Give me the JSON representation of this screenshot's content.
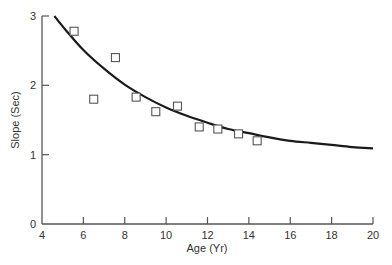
{
  "chart_data": {
    "type": "scatter",
    "title": "",
    "xlabel": "Age (Yr)",
    "ylabel": "Slope (Sec)",
    "xlim": [
      4,
      20
    ],
    "ylim": [
      0,
      3
    ],
    "xticks": [
      4,
      6,
      8,
      10,
      12,
      14,
      16,
      18,
      20
    ],
    "yticks": [
      0,
      1,
      2,
      3
    ],
    "grid": false,
    "legend": null,
    "series": [
      {
        "name": "observed",
        "type": "scatter",
        "marker": "open-square",
        "points": [
          {
            "x": 5.55,
            "y": 2.78
          },
          {
            "x": 6.5,
            "y": 1.8
          },
          {
            "x": 7.55,
            "y": 2.4
          },
          {
            "x": 8.55,
            "y": 1.83
          },
          {
            "x": 9.5,
            "y": 1.62
          },
          {
            "x": 10.55,
            "y": 1.7
          },
          {
            "x": 11.6,
            "y": 1.4
          },
          {
            "x": 12.5,
            "y": 1.37
          },
          {
            "x": 13.5,
            "y": 1.3
          },
          {
            "x": 14.4,
            "y": 1.2
          }
        ]
      },
      {
        "name": "fitted-curve",
        "type": "line",
        "points": [
          {
            "x": 4.6,
            "y": 3.0
          },
          {
            "x": 5,
            "y": 2.85
          },
          {
            "x": 6,
            "y": 2.51
          },
          {
            "x": 7,
            "y": 2.24
          },
          {
            "x": 8,
            "y": 2.01
          },
          {
            "x": 9,
            "y": 1.83
          },
          {
            "x": 10,
            "y": 1.68
          },
          {
            "x": 11,
            "y": 1.56
          },
          {
            "x": 12,
            "y": 1.46
          },
          {
            "x": 13,
            "y": 1.37
          },
          {
            "x": 14,
            "y": 1.31
          },
          {
            "x": 15,
            "y": 1.25
          },
          {
            "x": 16,
            "y": 1.2
          },
          {
            "x": 17,
            "y": 1.17
          },
          {
            "x": 18,
            "y": 1.14
          },
          {
            "x": 19,
            "y": 1.11
          },
          {
            "x": 20,
            "y": 1.09
          }
        ]
      }
    ]
  },
  "colors": {
    "axis": "#555555",
    "curve": "#1a1a1a",
    "marker": "#555555",
    "text": "#333333"
  }
}
